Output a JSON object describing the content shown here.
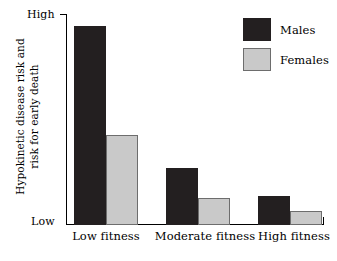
{
  "chart_data": {
    "type": "bar",
    "title": "",
    "subtitle": "",
    "xlabel": "",
    "ylabel": "Hypokinetic disease risk and risk for early death",
    "ylabel_lines": [
      "Hypokinetic disease risk and",
      "risk for early death"
    ],
    "categories": [
      "Low fitness",
      "Moderate fitness",
      "High fitness"
    ],
    "series": [
      {
        "name": "Males",
        "color": "#231f20",
        "values": [
          97,
          28,
          14
        ]
      },
      {
        "name": "Females",
        "color": "#c9c9c9",
        "values": [
          44,
          13,
          7
        ]
      }
    ],
    "ylim": [
      0,
      100
    ],
    "ytick_labels": [
      "Low",
      "High"
    ],
    "y_axis_low_label": "Low",
    "y_axis_high_label": "High",
    "grid": false,
    "legend_position": "top-right",
    "legend_entries": [
      {
        "label": "Males",
        "color": "#231f20"
      },
      {
        "label": "Females",
        "color": "#c9c9c9"
      }
    ],
    "annotations": []
  },
  "axis": {
    "high_label": "High",
    "low_label": "Low"
  },
  "legend": {
    "males_label": "Males",
    "females_label": "Females"
  },
  "caption": {
    "fragment": ""
  }
}
